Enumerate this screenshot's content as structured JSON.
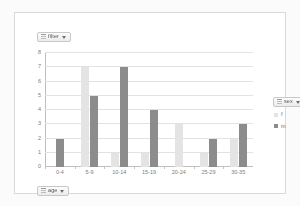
{
  "window": {
    "background_color": "#fbfbfb",
    "panel_background_color": "#ffffff",
    "panel_border_color": "#d9d9d9"
  },
  "pivot_fields": {
    "page_field": {
      "label": "filter",
      "icon": "field-list-icon",
      "caret": "chevron-down-icon"
    },
    "axis_field": {
      "label": "age",
      "icon": "field-list-icon",
      "caret": "chevron-down-icon"
    },
    "legend_field": {
      "label": "sex",
      "icon": "field-list-icon",
      "caret": "chevron-down-icon"
    }
  },
  "chart_data": {
    "type": "bar",
    "title": "",
    "subtitle": "",
    "xlabel": "",
    "ylabel": "",
    "ylim": [
      0,
      8
    ],
    "y_ticks": [
      0,
      1,
      2,
      3,
      4,
      5,
      6,
      7,
      8
    ],
    "grid": true,
    "legend_position": "right",
    "categories": [
      "0-4",
      "5-9",
      "10-14",
      "15-19",
      "20-24",
      "25-29",
      "30-35"
    ],
    "series": [
      {
        "name": "f",
        "color": "#e4e4e4",
        "values": [
          0,
          7,
          1,
          1,
          3,
          1,
          2
        ]
      },
      {
        "name": "m",
        "color": "#8c8c8c",
        "values": [
          2,
          5,
          7,
          4,
          0,
          2,
          3
        ]
      }
    ]
  },
  "legend": {
    "entries": [
      {
        "label": "f",
        "swatch": "series-f-swatch"
      },
      {
        "label": "m",
        "swatch": "series-m-swatch"
      }
    ]
  }
}
